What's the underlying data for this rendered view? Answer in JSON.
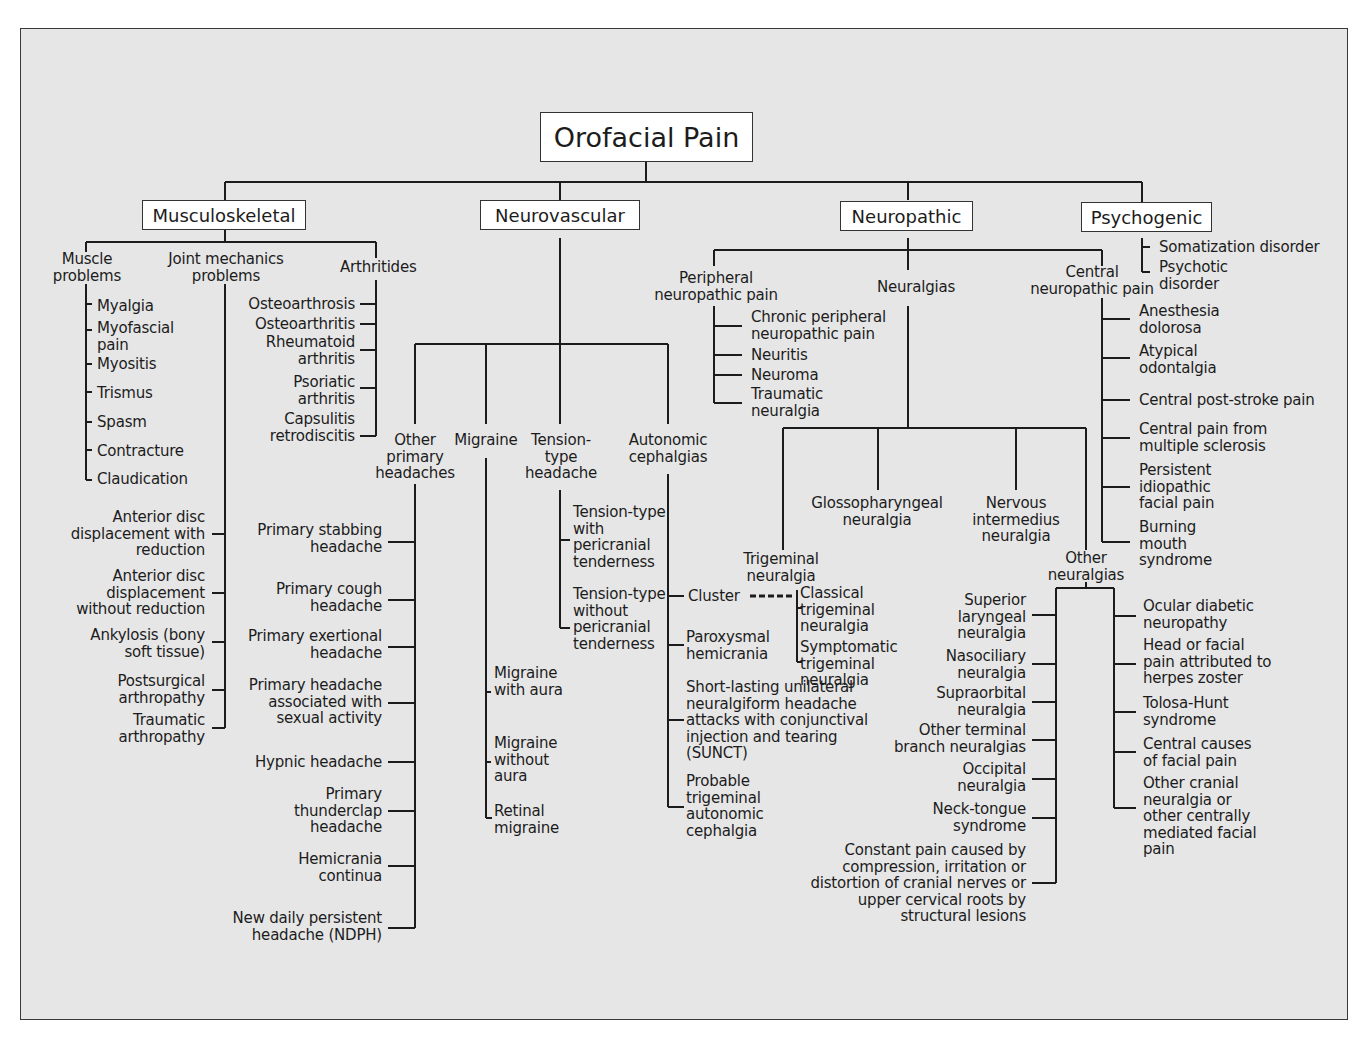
{
  "title": "Orofacial Pain",
  "categories": {
    "musculoskeletal": {
      "label": "Musculoskeletal",
      "groups": {
        "muscle": {
          "label": "Muscle problems",
          "items": [
            "Myalgia",
            "Myofascial pain",
            "Myositis",
            "Trismus",
            "Spasm",
            "Contracture",
            "Claudication"
          ]
        },
        "joint": {
          "label": "Joint mechanics problems",
          "items": [
            "Anterior disc displacement with reduction",
            "Anterior disc displacement without reduction",
            "Ankylosis (bony soft tissue)",
            "Postsurgical arthropathy",
            "Traumatic arthropathy"
          ]
        },
        "arthritides": {
          "label": "Arthritides",
          "items": [
            "Osteoarthrosis",
            "Osteoarthritis",
            "Rheumatoid arthritis",
            "Psoriatic arthritis",
            "Capsulitis retrodiscitis"
          ]
        }
      }
    },
    "neurovascular": {
      "label": "Neurovascular",
      "groups": {
        "other_primary": {
          "label": "Other primary headaches",
          "items": [
            "Primary stabbing headache",
            "Primary cough headache",
            "Primary exertional headache",
            "Primary headache associated with sexual activity",
            "Hypnic headache",
            "Primary thunderclap headache",
            "Hemicrania continua",
            "New daily persistent headache (NDPH)"
          ]
        },
        "migraine": {
          "label": "Migraine",
          "items": [
            "Migraine with aura",
            "Migraine without aura",
            "Retinal migraine"
          ]
        },
        "tension": {
          "label": "Tension-type headache",
          "items": [
            "Tension-type with pericranial tenderness",
            "Tension-type without pericranial tenderness"
          ]
        },
        "autonomic": {
          "label": "Autonomic cephalgias",
          "items": [
            "Cluster",
            "Paroxysmal hemicrania",
            "Short-lasting unilateral neuralgiform headache attacks with conjunctival injection and tearing (SUNCT)",
            "Probable trigeminal autonomic cephalgia"
          ]
        }
      }
    },
    "neuropathic": {
      "label": "Neuropathic",
      "groups": {
        "peripheral": {
          "label": "Peripheral neuropathic pain",
          "items": [
            "Chronic peripheral neuropathic pain",
            "Neuritis",
            "Neuroma",
            "Traumatic neuralgia"
          ]
        },
        "neuralgias": {
          "label": "Neuralgias",
          "trigeminal": {
            "label": "Trigeminal neuralgia",
            "items": [
              "Classical trigeminal neuralgia",
              "Symptomatic trigeminal neuralgia"
            ]
          },
          "glossopharyngeal": "Glossopharyngeal neuralgia",
          "nervous_intermedius": "Nervous intermedius neuralgia",
          "other": {
            "label": "Other neuralgias",
            "left_items": [
              "Superior laryngeal neuralgia",
              "Nasociliary neuralgia",
              "Supraorbital neuralgia",
              "Other terminal branch neuralgias",
              "Occipital neuralgia",
              "Neck-tongue syndrome",
              "Constant pain caused by compression, irritation or distortion of cranial nerves or upper cervical roots by structural lesions"
            ],
            "right_items": [
              "Ocular diabetic neuropathy",
              "Head or facial pain attributed to herpes zoster",
              "Tolosa-Hunt syndrome",
              "Central causes of facial pain",
              "Other cranial neuralgia or other centrally mediated facial pain"
            ]
          }
        },
        "central": {
          "label": "Central neuropathic pain",
          "items": [
            "Anesthesia dolorosa",
            "Atypical odontalgia",
            "Central post-stroke pain",
            "Central pain from multiple sclerosis",
            "Persistent idiopathic facial pain",
            "Burning mouth syndrome"
          ]
        }
      }
    },
    "psychogenic": {
      "label": "Psychogenic",
      "items": [
        "Somatization disorder",
        "Psychotic disorder"
      ]
    }
  },
  "colors": {
    "panel_bg": "#e6e6e6",
    "line": "#1c1c1c",
    "box_bg": "#ffffff"
  }
}
